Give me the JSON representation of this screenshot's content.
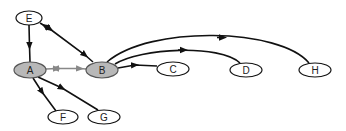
{
  "diagram": {
    "type": "directed-graph",
    "colors": {
      "background": "#ffffff",
      "node_fill_default": "#ffffff",
      "node_fill_highlight": "#b8b8b8",
      "node_stroke": "#111111",
      "edge_default": "#111111",
      "edge_highlight": "#888888"
    },
    "nodes": [
      {
        "id": "E",
        "label": "E",
        "cx": 29,
        "cy": 18,
        "rx": 13,
        "ry": 7,
        "highlighted": false
      },
      {
        "id": "A",
        "label": "A",
        "cx": 30,
        "cy": 70,
        "rx": 16,
        "ry": 8,
        "highlighted": true
      },
      {
        "id": "B",
        "label": "B",
        "cx": 102,
        "cy": 70,
        "rx": 16,
        "ry": 8,
        "highlighted": true
      },
      {
        "id": "C",
        "label": "C",
        "cx": 173,
        "cy": 69,
        "rx": 16,
        "ry": 7,
        "highlighted": false
      },
      {
        "id": "D",
        "label": "D",
        "cx": 246,
        "cy": 70,
        "rx": 16,
        "ry": 7,
        "highlighted": false
      },
      {
        "id": "H",
        "label": "H",
        "cx": 315,
        "cy": 70,
        "rx": 16,
        "ry": 7,
        "highlighted": false
      },
      {
        "id": "F",
        "label": "F",
        "cx": 63,
        "cy": 117,
        "rx": 15,
        "ry": 7,
        "highlighted": false
      },
      {
        "id": "G",
        "label": "G",
        "cx": 104,
        "cy": 117,
        "rx": 16,
        "ry": 7,
        "highlighted": false
      }
    ],
    "edges": [
      {
        "from": "E",
        "to": "A",
        "style": "default",
        "direction": "forward"
      },
      {
        "from": "E",
        "to": "B",
        "style": "default",
        "direction": "both"
      },
      {
        "from": "A",
        "to": "B",
        "style": "highlight",
        "direction": "both"
      },
      {
        "from": "A",
        "to": "F",
        "style": "default",
        "direction": "forward"
      },
      {
        "from": "A",
        "to": "G",
        "style": "default",
        "direction": "forward"
      },
      {
        "from": "B",
        "to": "C",
        "style": "default",
        "direction": "forward"
      },
      {
        "from": "B",
        "to": "D",
        "style": "default",
        "direction": "forward",
        "curved": true
      },
      {
        "from": "B",
        "to": "H",
        "style": "default",
        "direction": "forward",
        "curved": true
      }
    ]
  }
}
